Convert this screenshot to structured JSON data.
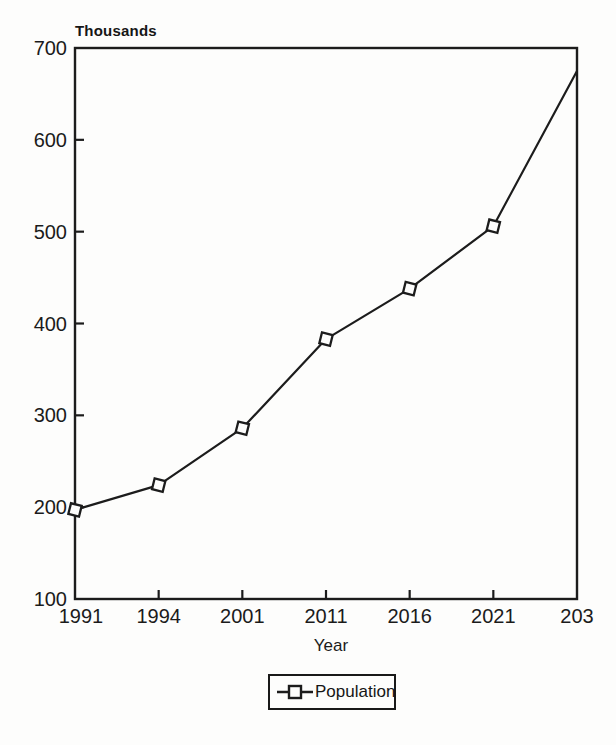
{
  "chart_data": {
    "type": "line",
    "title": "",
    "ylabel": "Thousands",
    "xlabel": "Year",
    "categories": [
      "1991",
      "1994",
      "2001",
      "2011",
      "2016",
      "2021",
      "203"
    ],
    "series": [
      {
        "name": "Population",
        "values": [
          197,
          224,
          286,
          383,
          438,
          506,
          675
        ],
        "markers_shown": [
          true,
          true,
          true,
          true,
          true,
          true,
          false
        ]
      }
    ],
    "ylim": [
      100,
      700
    ],
    "yticks": [
      100,
      200,
      300,
      400,
      500,
      600,
      700
    ],
    "grid": false,
    "legend_position": "bottom-center",
    "marker_style": "open-square",
    "line_color": "#1c1c1c",
    "background_color": "#fdfdfc"
  }
}
